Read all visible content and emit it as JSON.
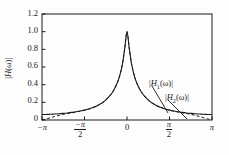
{
  "figure": {
    "background_color": "#fdfdfd",
    "axis_color": "#1a1a1a",
    "curve_color": "#1a1a1a"
  },
  "axes": {
    "y_label": "|H(ω)|",
    "y_ticks": [
      "0",
      "0.2",
      "0.4",
      "0.6",
      "0.8",
      "1.0",
      "1.2"
    ],
    "y_tick_values": [
      0,
      0.2,
      0.4,
      0.6,
      0.8,
      1.0,
      1.2
    ],
    "x_ticks": [
      "−π",
      "−π/2",
      "0",
      "π/2",
      "π"
    ],
    "x_tick_values": [
      -3.14159,
      -1.5708,
      0,
      1.5708,
      3.14159
    ],
    "x_tick_parts": [
      {
        "kind": "plain",
        "text": "−π"
      },
      {
        "kind": "frac",
        "num": "−π",
        "den": "2"
      },
      {
        "kind": "plain",
        "text": "0"
      },
      {
        "kind": "frac",
        "num": "π",
        "den": "2"
      },
      {
        "kind": "plain",
        "text": "π"
      }
    ]
  },
  "annotations": [
    {
      "id": "h1",
      "label_head": "|H",
      "label_sub": "1",
      "label_tail": "(ω)|",
      "label_plain": "|H₁(ω)|",
      "leader_from": [
        152,
        86
      ],
      "leader_to": [
        168,
        113
      ]
    },
    {
      "id": "h2",
      "label_head": "|H",
      "label_sub": "2",
      "label_tail": "(ω)|",
      "label_plain": "|H₂(ω)|",
      "leader_from": [
        168,
        100
      ],
      "leader_to": [
        187,
        119
      ]
    }
  ],
  "chart_data": {
    "type": "line",
    "title": "",
    "xlabel": "",
    "ylabel": "|H(ω)|",
    "xlim": [
      -3.14159,
      3.14159
    ],
    "ylim": [
      0,
      1.2
    ],
    "grid": false,
    "legend": "annotated-inline",
    "x": [
      -3.14159,
      -2.98,
      -2.82,
      -2.67,
      -2.51,
      -2.36,
      -2.2,
      -2.04,
      -1.88,
      -1.73,
      -1.57,
      -1.41,
      -1.26,
      -1.1,
      -0.94,
      -0.79,
      -0.63,
      -0.55,
      -0.47,
      -0.39,
      -0.31,
      -0.24,
      -0.16,
      -0.08,
      0,
      0.08,
      0.16,
      0.24,
      0.31,
      0.39,
      0.47,
      0.55,
      0.63,
      0.79,
      0.94,
      1.1,
      1.26,
      1.41,
      1.57,
      1.73,
      1.88,
      2.04,
      2.2,
      2.36,
      2.51,
      2.67,
      2.82,
      2.98,
      3.14159
    ],
    "series": [
      {
        "name": "|H₁(ω)|",
        "style": "solid",
        "values": [
          0.062,
          0.063,
          0.065,
          0.068,
          0.071,
          0.075,
          0.08,
          0.086,
          0.093,
          0.102,
          0.112,
          0.125,
          0.141,
          0.162,
          0.189,
          0.225,
          0.275,
          0.308,
          0.348,
          0.398,
          0.46,
          0.535,
          0.648,
          0.82,
          1.0,
          0.82,
          0.648,
          0.535,
          0.46,
          0.398,
          0.348,
          0.308,
          0.275,
          0.225,
          0.189,
          0.162,
          0.141,
          0.125,
          0.112,
          0.102,
          0.093,
          0.086,
          0.08,
          0.075,
          0.071,
          0.068,
          0.065,
          0.063,
          0.062
        ]
      },
      {
        "name": "|H₂(ω)|",
        "style": "dashed",
        "values": [
          0.0,
          0.012,
          0.026,
          0.04,
          0.053,
          0.064,
          0.073,
          0.081,
          0.09,
          0.1,
          0.111,
          0.124,
          0.141,
          0.162,
          0.189,
          0.225,
          0.275,
          0.308,
          0.348,
          0.398,
          0.46,
          0.535,
          0.648,
          0.82,
          1.0,
          0.82,
          0.648,
          0.535,
          0.46,
          0.398,
          0.348,
          0.308,
          0.275,
          0.225,
          0.189,
          0.162,
          0.141,
          0.124,
          0.111,
          0.1,
          0.09,
          0.081,
          0.073,
          0.064,
          0.053,
          0.04,
          0.026,
          0.012,
          0.0
        ]
      }
    ]
  }
}
